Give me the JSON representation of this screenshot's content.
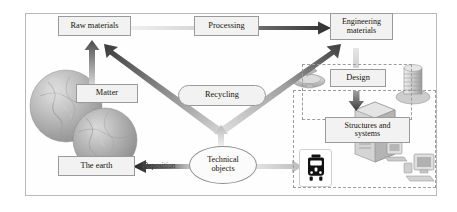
{
  "diagram": {
    "frame": {
      "border_color": "#b9b9b9"
    },
    "nodes": [
      {
        "id": "raw-materials",
        "label": "Raw materials",
        "shape": "rect"
      },
      {
        "id": "processing",
        "label": "Processing",
        "shape": "rect"
      },
      {
        "id": "engineering-materials",
        "label": "Engineering\nmaterials",
        "shape": "rect"
      },
      {
        "id": "matter",
        "label": "Matter",
        "shape": "rect"
      },
      {
        "id": "recycling",
        "label": "Recycling",
        "shape": "rounded-rect"
      },
      {
        "id": "the-earth",
        "label": "The earth",
        "shape": "rect"
      },
      {
        "id": "technical-objects",
        "label": "Technical\nobjects",
        "shape": "ellipse"
      },
      {
        "id": "design",
        "label": "Design",
        "shape": "rect"
      },
      {
        "id": "structures-systems",
        "label": "Structures and\nsystems",
        "shape": "rect"
      }
    ],
    "labels": {
      "raw_materials": "Raw materials",
      "processing": "Processing",
      "engineering_materials_line1": "Engineering",
      "engineering_materials_line2": "materials",
      "matter": "Matter",
      "recycling": "Recycling",
      "the_earth": "The earth",
      "deposition": "Deposition",
      "technical_objects_line1": "Technical",
      "technical_objects_line2": "objects",
      "design": "Design",
      "structures_line1": "Structures and",
      "structures_line2": "systems"
    },
    "arrows": [
      {
        "id": "matter-to-raw-materials",
        "from": "matter",
        "to": "raw-materials",
        "direction": "up",
        "shade": "dark-gray"
      },
      {
        "id": "raw-materials-to-engineering",
        "from": "raw-materials",
        "to": "engineering-materials",
        "direction": "right",
        "shade": "gradient-light-to-dark",
        "label": "Processing"
      },
      {
        "id": "engineering-to-design",
        "from": "engineering-materials",
        "to": "design",
        "direction": "down",
        "shade": "light-gray"
      },
      {
        "id": "design-to-structures",
        "from": "design",
        "to": "structures-systems",
        "direction": "down",
        "shade": "dark-gray"
      },
      {
        "id": "technical-objects-to-raw-materials",
        "from": "technical-objects",
        "to": "raw-materials",
        "direction": "up-left",
        "shade": "dark-gray"
      },
      {
        "id": "technical-objects-to-engineering",
        "from": "technical-objects",
        "to": "engineering-materials",
        "direction": "up-right",
        "shade": "gradient"
      },
      {
        "id": "recycling-to-technical-objects",
        "from": "recycling",
        "to": "technical-objects",
        "direction": "up",
        "shade": "light-gray"
      },
      {
        "id": "technical-objects-to-the-earth",
        "from": "technical-objects",
        "to": "the-earth",
        "direction": "left",
        "shade": "dark-gray",
        "label": "Deposition"
      },
      {
        "id": "technical-objects-to-train",
        "from": "technical-objects",
        "to": "train-icon",
        "direction": "right",
        "shade": "light-gray"
      }
    ],
    "icons": [
      {
        "id": "globe-large-icon",
        "name": "globe-icon"
      },
      {
        "id": "globe-small-icon",
        "name": "globe-icon"
      },
      {
        "id": "satellite-icon",
        "name": "satellite-dish-icon"
      },
      {
        "id": "server-stack-icon",
        "name": "server-stack-icon"
      },
      {
        "id": "server-tower-icon",
        "name": "server-tower-icon"
      },
      {
        "id": "train-icon",
        "name": "train-icon"
      },
      {
        "id": "computer-icon",
        "name": "desktop-computer-icon"
      }
    ],
    "groups": [
      {
        "id": "design-group",
        "style": "dashed"
      },
      {
        "id": "systems-group",
        "style": "dashed"
      }
    ],
    "colors": {
      "box_fill": "#f2f2f2",
      "box_border": "#9a9a9a",
      "arrow_dark": "#3a3a3a",
      "arrow_light": "#cfcfcf",
      "dashed_border": "#9c9c9c",
      "frame_border": "#b9b9b9",
      "text": "#18120c"
    }
  }
}
